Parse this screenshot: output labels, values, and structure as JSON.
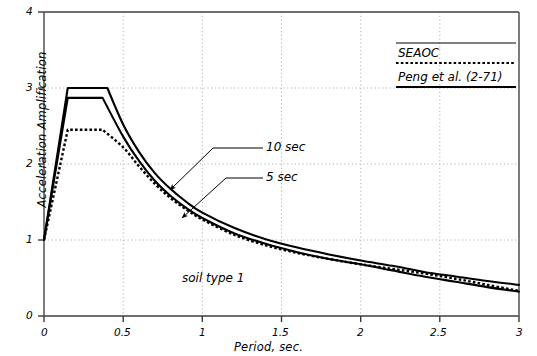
{
  "chart_data": {
    "type": "line",
    "title": "",
    "xlabel": "Period, sec.",
    "ylabel": "Acceleration Amplification",
    "xlim": [
      0,
      3
    ],
    "ylim": [
      0,
      4
    ],
    "xticks": [
      "0",
      "0.5",
      "1",
      "1.5",
      "2",
      "2.5",
      "3"
    ],
    "xtick_values": [
      0,
      0.5,
      1,
      1.5,
      2,
      2.5,
      3
    ],
    "yticks": [
      "0",
      "1",
      "2",
      "3",
      "4"
    ],
    "ytick_values": [
      0,
      1,
      2,
      3,
      4
    ],
    "grid": "dotted gridlines at x = 0.5, 1, 1.5, 2, 2.5 and y = 1, 2, 3",
    "legend_position": "top-right inside plot area",
    "series": [
      {
        "name": "Peng et al. (2-71) - 10 sec",
        "style": "solid",
        "color": "#000000",
        "x": [
          0,
          0.15,
          0.4,
          0.5,
          0.6,
          0.7,
          0.8,
          0.9,
          1.0,
          1.2,
          1.4,
          1.6,
          1.8,
          2.0,
          2.2,
          2.4,
          2.6,
          2.8,
          3.0
        ],
        "y": [
          1.0,
          3.0,
          3.0,
          2.52,
          2.16,
          1.88,
          1.67,
          1.5,
          1.36,
          1.16,
          1.01,
          0.9,
          0.81,
          0.73,
          0.66,
          0.58,
          0.52,
          0.46,
          0.41
        ]
      },
      {
        "name": "Peng et al. (2-71) - 5 sec",
        "style": "solid",
        "color": "#000000",
        "x": [
          0,
          0.15,
          0.37,
          0.5,
          0.6,
          0.7,
          0.8,
          0.9,
          1.0,
          1.2,
          1.4,
          1.6,
          1.8,
          2.0,
          2.2,
          2.4,
          2.6,
          2.8,
          3.0
        ],
        "y": [
          1.0,
          2.87,
          2.87,
          2.36,
          2.04,
          1.78,
          1.58,
          1.42,
          1.29,
          1.09,
          0.95,
          0.84,
          0.75,
          0.68,
          0.6,
          0.52,
          0.45,
          0.38,
          0.32
        ]
      },
      {
        "name": "SEAOC",
        "style": "dotted",
        "color": "#000000",
        "x": [
          0,
          0.15,
          0.37,
          0.5,
          0.6,
          0.7,
          0.8,
          0.9,
          1.0,
          1.2,
          1.4,
          1.6,
          1.8,
          2.0,
          2.2,
          2.4,
          2.6,
          2.8,
          3.0
        ],
        "y": [
          1.0,
          2.45,
          2.45,
          2.22,
          1.97,
          1.74,
          1.55,
          1.4,
          1.27,
          1.07,
          0.93,
          0.83,
          0.75,
          0.68,
          0.62,
          0.56,
          0.49,
          0.41,
          0.33
        ]
      }
    ],
    "annotations": [
      {
        "text": "10 sec",
        "at_x": 1.33,
        "at_y": 2.35,
        "points_to_x": 0.8,
        "points_to_y": 1.66
      },
      {
        "text": "5 sec",
        "at_x": 1.33,
        "at_y": 1.98,
        "points_to_x": 0.9,
        "points_to_y": 1.34
      },
      {
        "text": "soil type 1",
        "at_x": 0.95,
        "at_y": 0.64,
        "points_to_x": null,
        "points_to_y": null
      }
    ]
  },
  "legend": {
    "items": [
      {
        "label": "SEAOC",
        "style": "dotted"
      },
      {
        "label": "Peng et al. (2-71)",
        "style": "solid"
      }
    ]
  },
  "axes": {
    "x_title": "Period, sec.",
    "y_title": "Acceleration Amplification",
    "x_tick_labels": [
      "0",
      "0.5",
      "1",
      "1.5",
      "2",
      "2.5",
      "3"
    ],
    "y_tick_labels": [
      "0",
      "1",
      "2",
      "3",
      "4"
    ]
  },
  "annotations": {
    "ten_sec": "10 sec",
    "five_sec": "5 sec",
    "soil_type": "soil type 1"
  },
  "colors": {
    "line": "#000000",
    "frame": "#6b6b6b",
    "grid": "#b4b4b4",
    "background": "#ffffff"
  }
}
